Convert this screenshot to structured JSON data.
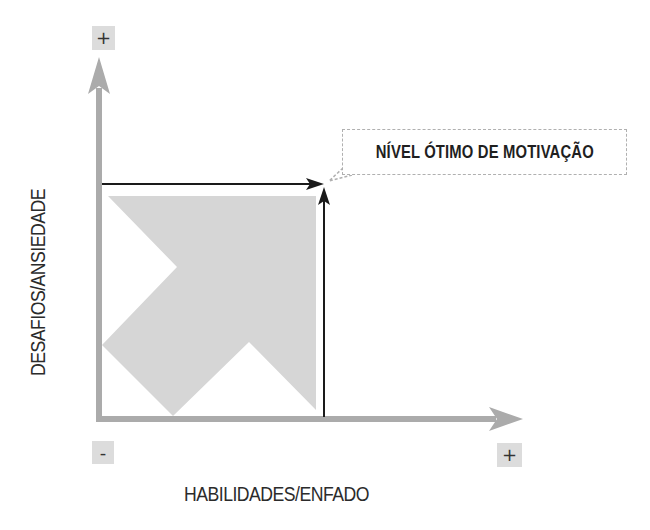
{
  "diagram": {
    "title": "Nível ótimo de motivação",
    "type": "flow-channel diagram",
    "callout": {
      "text": "NÍVEL ÓTIMO DE MOTIVAÇÃO"
    },
    "axes": {
      "x": {
        "label": "HABILIDADES/ENFADO",
        "min_marker": "-",
        "max_marker": "+"
      },
      "y": {
        "label": "DESAFIOS/ANSIEDADE",
        "max_marker": "+"
      }
    },
    "colors": {
      "axis": "#ababab",
      "shape_fill": "#d6d6d6",
      "marker_box": "#dcdcdc",
      "guide_lines": "#1a1a1a",
      "callout_border": "#b0b0b0",
      "text": "#2b2b2b"
    }
  }
}
